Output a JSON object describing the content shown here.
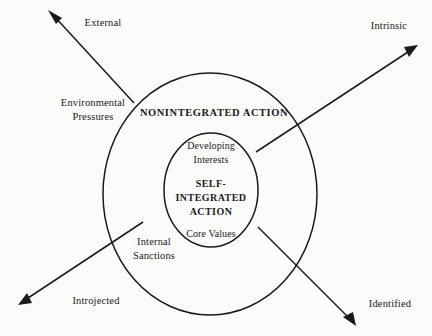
{
  "diagram": {
    "type": "concentric-ellipse-axis-diagram",
    "background_color": "#fbfbfa",
    "stroke_color": "#1a1a1a",
    "ellipses": {
      "outer": {
        "label": "NONINTEGRATED ACTION",
        "cx": 210,
        "cy": 194,
        "rx": 107,
        "ry": 121,
        "label_x": 214,
        "label_y": 114
      },
      "inner": {
        "label_line1": "SELF-",
        "label_line2": "INTEGRATED",
        "label_line3": "ACTION",
        "cx": 211,
        "cy": 190,
        "rx": 47,
        "ry": 57,
        "label_x": 211,
        "label_y": 185
      }
    },
    "inner_annotations": {
      "top_line1": "Developing",
      "top_line2": "Interests",
      "top_x": 211,
      "top_y1": 147,
      "top_y2": 161,
      "bottom": "Core Values",
      "bottom_x": 211,
      "bottom_y": 235
    },
    "axis_labels": {
      "top_left": "External",
      "top_right": "Intrinsic",
      "bottom_left": "Introjected",
      "bottom_right": "Identified"
    },
    "mid_labels": {
      "left_top_line1": "Environmental",
      "left_top_line2": "Pressures",
      "left_bottom_line1": "Internal",
      "left_bottom_line2": "Sanctions"
    },
    "arrows": [
      {
        "name": "external-arrow",
        "from_x": 134,
        "from_y": 103,
        "to_x": 48,
        "to_y": 10,
        "label": "External",
        "label_x": 103,
        "label_y": 24
      },
      {
        "name": "intrinsic-arrow",
        "from_x": 256,
        "from_y": 152,
        "to_x": 418,
        "to_y": 45,
        "label": "Intrinsic",
        "label_x": 389,
        "label_y": 27
      },
      {
        "name": "introjected-arrow",
        "from_x": 143,
        "from_y": 222,
        "to_x": 18,
        "to_y": 305,
        "label": "Introjected",
        "label_x": 96,
        "label_y": 302
      },
      {
        "name": "identified-arrow",
        "from_x": 258,
        "from_y": 227,
        "to_x": 356,
        "to_y": 326,
        "label": "Identified",
        "label_x": 390,
        "label_y": 305
      }
    ],
    "mid_label_positions": {
      "environmental_x": 93,
      "environmental_y1": 104,
      "environmental_y2": 118,
      "internal_x": 154,
      "internal_y1": 243,
      "internal_y2": 257
    }
  }
}
